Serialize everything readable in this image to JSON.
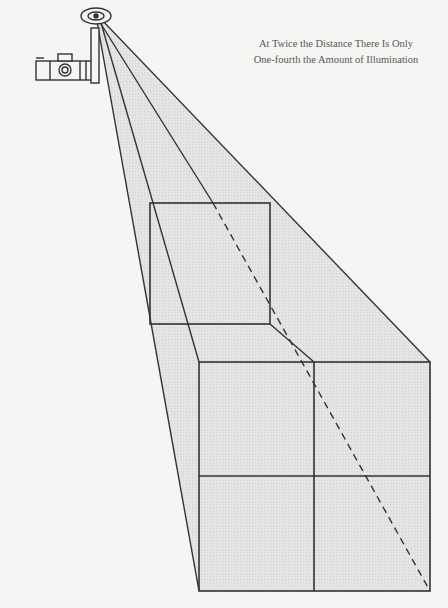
{
  "caption": {
    "line1": "At Twice the Distance There Is Only",
    "line2": "One-fourth the Amount of Illumination"
  },
  "diagram": {
    "type": "inverse-square-law",
    "light_source": "camera-flash",
    "near_square_label": "",
    "far_square_label": "",
    "far_square_subdivisions": 4,
    "colors": {
      "background": "#f5f5f3",
      "beam_fill": "#e2e2e0",
      "line": "#333333",
      "text": "#555555"
    }
  }
}
